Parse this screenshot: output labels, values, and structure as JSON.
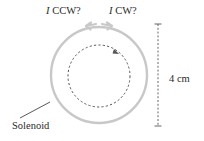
{
  "diagram": {
    "labels": {
      "ccw_symbol": "I",
      "ccw_text": " CCW?",
      "cw_symbol": "I",
      "cw_text": " CW?",
      "dimension": "4 cm",
      "solenoid": "Solenoid"
    },
    "colors": {
      "solenoid": "#c8c8c8",
      "dashed_loop": "#555555",
      "dimension_line": "#666666",
      "text": "#2a2a2a"
    },
    "elements": {
      "solenoid_circle": {
        "cx": 99,
        "cy": 75,
        "r": 48
      },
      "inner_dashed_circle": {
        "cx": 99,
        "cy": 76,
        "r": 31
      },
      "dimension_line": {
        "x": 158,
        "y1": 24,
        "y2": 126
      }
    }
  }
}
